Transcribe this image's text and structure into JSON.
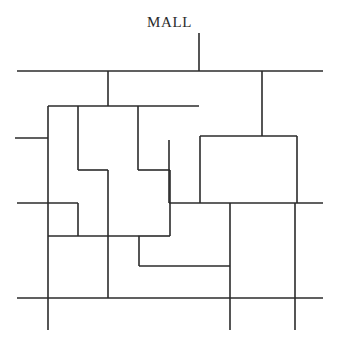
{
  "diagram": {
    "title": "MALL",
    "type": "site-plan-line-drawing",
    "canvas": {
      "width": 339,
      "height": 350,
      "background": "#ffffff"
    },
    "line_color": "#2b2b2b",
    "line_width": 1.6,
    "label": {
      "text": "MALL",
      "x": 199,
      "y": 22,
      "font_size": 15,
      "anchor": "middle"
    },
    "segments": [
      {
        "name": "mall-leader-stem",
        "x1": 199,
        "y1": 33,
        "x2": 199,
        "y2": 71
      },
      {
        "name": "top-boundary-street",
        "x1": 17,
        "y1": 71,
        "x2": 323,
        "y2": 71
      },
      {
        "name": "upper-left-vertical-spur",
        "x1": 108,
        "y1": 71,
        "x2": 108,
        "y2": 106
      },
      {
        "name": "upper-right-vertical-spur",
        "x1": 262,
        "y1": 71,
        "x2": 262,
        "y2": 136
      },
      {
        "name": "block-a-top-edge",
        "x1": 48,
        "y1": 106,
        "x2": 199,
        "y2": 106
      },
      {
        "name": "block-a-left-vertical",
        "x1": 48,
        "y1": 106,
        "x2": 48,
        "y2": 236
      },
      {
        "name": "left-margin-stub",
        "x1": 15,
        "y1": 138,
        "x2": 48,
        "y2": 138
      },
      {
        "name": "block-b-left-vertical",
        "x1": 78,
        "y1": 106,
        "x2": 78,
        "y2": 170
      },
      {
        "name": "block-b-step-horizontal",
        "x1": 78,
        "y1": 170,
        "x2": 108,
        "y2": 170
      },
      {
        "name": "block-b-step-vertical",
        "x1": 108,
        "y1": 170,
        "x2": 108,
        "y2": 298
      },
      {
        "name": "block-c-left-vertical",
        "x1": 138,
        "y1": 106,
        "x2": 138,
        "y2": 170
      },
      {
        "name": "block-c-step-horizontal",
        "x1": 138,
        "y1": 170,
        "x2": 170,
        "y2": 170
      },
      {
        "name": "block-c-inner-vertical",
        "x1": 169,
        "y1": 140,
        "x2": 169,
        "y2": 203
      },
      {
        "name": "block-c-lower-vertical",
        "x1": 170,
        "y1": 170,
        "x2": 170,
        "y2": 236
      },
      {
        "name": "block-d-top-edge",
        "x1": 200,
        "y1": 136,
        "x2": 297,
        "y2": 136
      },
      {
        "name": "block-d-left-vertical",
        "x1": 200,
        "y1": 136,
        "x2": 200,
        "y2": 203
      },
      {
        "name": "block-d-right-vertical",
        "x1": 297,
        "y1": 136,
        "x2": 297,
        "y2": 203
      },
      {
        "name": "mid-boundary-street-left",
        "x1": 17,
        "y1": 203,
        "x2": 78,
        "y2": 203
      },
      {
        "name": "mid-boundary-street-right",
        "x1": 169,
        "y1": 203,
        "x2": 323,
        "y2": 203
      },
      {
        "name": "block-e-right-vertical",
        "x1": 78,
        "y1": 203,
        "x2": 78,
        "y2": 236
      },
      {
        "name": "block-e-bottom-edge",
        "x1": 48,
        "y1": 236,
        "x2": 138,
        "y2": 236
      },
      {
        "name": "block-f-top-edge",
        "x1": 138,
        "y1": 236,
        "x2": 170,
        "y2": 236
      },
      {
        "name": "block-f-step-vertical",
        "x1": 139,
        "y1": 236,
        "x2": 139,
        "y2": 266
      },
      {
        "name": "block-f-bottom-edge",
        "x1": 139,
        "y1": 266,
        "x2": 230,
        "y2": 266
      },
      {
        "name": "block-g-left-vertical",
        "x1": 230,
        "y1": 203,
        "x2": 230,
        "y2": 330
      },
      {
        "name": "block-g-right-vertical",
        "x1": 295,
        "y1": 203,
        "x2": 295,
        "y2": 330
      },
      {
        "name": "bottom-boundary-street",
        "x1": 17,
        "y1": 298,
        "x2": 323,
        "y2": 298
      },
      {
        "name": "bottom-left-vertical",
        "x1": 48,
        "y1": 236,
        "x2": 48,
        "y2": 330
      }
    ]
  }
}
